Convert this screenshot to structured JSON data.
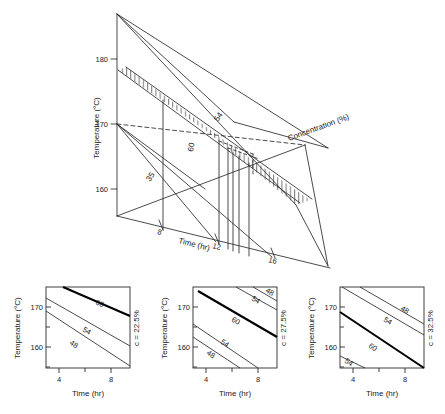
{
  "figure": {
    "kind": "scientific-figure",
    "background": "#ffffff",
    "line_color": "#2b2b2b",
    "bold_line_color": "#000000"
  },
  "main_plot": {
    "name": "3d-surface-plot",
    "axes": {
      "y": {
        "label": "Temperature (°C)",
        "ticks": [
          "160",
          "170",
          "180"
        ],
        "values": [
          160,
          170,
          180
        ],
        "min": 155,
        "max": 185
      },
      "x": {
        "label": "Time (hr)",
        "ticks": [
          "8",
          "12",
          "16"
        ],
        "values": [
          8,
          12,
          16
        ],
        "min": 4,
        "max": 18
      },
      "z": {
        "label": "Concentration (%)",
        "ticks": [],
        "min": 22.5,
        "max": 32.5
      }
    },
    "contour_labels": [
      {
        "text": "54",
        "id": "main-contour-54"
      },
      {
        "text": "60",
        "id": "main-contour-60"
      },
      {
        "text": "35",
        "id": "main-contour-35"
      }
    ],
    "hatched_region": {
      "name": "feasible-region-hatching",
      "style": "vertical-line-hatch",
      "stripe_count": 26
    }
  },
  "subplots": [
    {
      "id": "subplot-left",
      "concentration_label": "c = 22.5%",
      "x": {
        "label": "Time (hr)",
        "ticks": [
          "4",
          "8"
        ],
        "values": [
          4,
          8
        ],
        "min": 3,
        "max": 9.5
      },
      "y": {
        "label": "Temperature (°C)",
        "ticks": [
          "170",
          "160"
        ],
        "values": [
          170,
          160
        ],
        "min": 157,
        "max": 175
      },
      "contours": [
        {
          "label": "60",
          "bold": true,
          "x0": 5.6,
          "y0": 175.0,
          "x1": 9.5,
          "y1": 168.6
        },
        {
          "label": "54",
          "bold": false,
          "x0": 3.0,
          "y0": 172.6,
          "x1": 9.5,
          "y1": 161.8
        },
        {
          "label": "48",
          "bold": false,
          "x0": 3.0,
          "y0": 169.6,
          "x1": 9.5,
          "y1": 157.4
        }
      ]
    },
    {
      "id": "subplot-middle",
      "concentration_label": "c = 27.5%",
      "x": {
        "label": "Time (hr)",
        "ticks": [
          "4",
          "8"
        ],
        "values": [
          4,
          8
        ],
        "min": 3,
        "max": 9.5
      },
      "y": {
        "label": "Temperature (°C)",
        "ticks": [
          "170",
          "160"
        ],
        "values": [
          170,
          160
        ],
        "min": 157,
        "max": 175
      },
      "contours": [
        {
          "label": "48",
          "bold": false,
          "x0": 7.6,
          "y0": 175.0,
          "x1": 9.5,
          "y1": 172.0
        },
        {
          "label": "54",
          "bold": false,
          "x0": 6.3,
          "y0": 175.0,
          "x1": 9.5,
          "y1": 169.8
        },
        {
          "label": "60",
          "bold": true,
          "x0": 3.4,
          "y0": 174.0,
          "x1": 9.5,
          "y1": 163.6
        },
        {
          "label": "54",
          "bold": false,
          "x0": 3.0,
          "y0": 166.8,
          "x1": 8.0,
          "y1": 157.4
        },
        {
          "label": "48",
          "bold": false,
          "x0": 3.0,
          "y0": 164.0,
          "x1": 6.6,
          "y1": 157.4
        }
      ]
    },
    {
      "id": "subplot-right",
      "concentration_label": "c = 32.5%",
      "x": {
        "label": "Time (hr)",
        "ticks": [
          "4",
          "8"
        ],
        "values": [
          4,
          8
        ],
        "min": 3,
        "max": 9.5
      },
      "y": {
        "label": "Temperature (°C)",
        "ticks": [
          "170",
          "160"
        ],
        "values": [
          170,
          160
        ],
        "min": 157,
        "max": 175
      },
      "contours": [
        {
          "label": "48",
          "bold": false,
          "x0": 4.6,
          "y0": 175.0,
          "x1": 9.5,
          "y1": 166.8
        },
        {
          "label": "54",
          "bold": false,
          "x0": 3.3,
          "y0": 175.0,
          "x1": 9.5,
          "y1": 164.2
        },
        {
          "label": "60",
          "bold": true,
          "x0": 3.0,
          "y0": 168.6,
          "x1": 9.5,
          "y1": 157.4
        },
        {
          "label": "54",
          "bold": false,
          "x0": 3.0,
          "y0": 159.6,
          "x1": 4.9,
          "y1": 157.4
        }
      ]
    }
  ]
}
